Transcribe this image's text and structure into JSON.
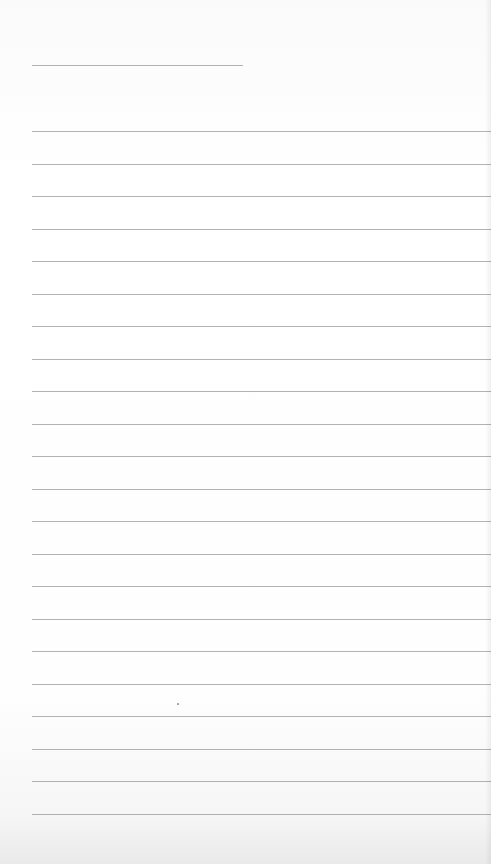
{
  "page": {
    "type": "lined-paper",
    "background_color": "#fdfdfd",
    "rule_color": "#9a9a9a"
  },
  "header_line": {
    "left": 32,
    "top": 65,
    "width": 211
  },
  "ruled_lines": {
    "left": 32,
    "first_top": 131,
    "spacing": 32.5,
    "count": 22
  }
}
